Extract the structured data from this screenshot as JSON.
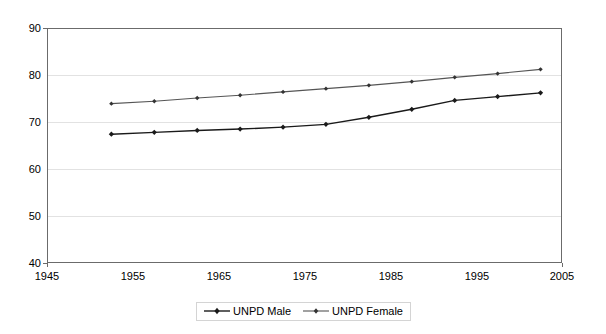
{
  "chart_data": {
    "type": "line",
    "title": "",
    "subtitle": "",
    "xlabel": "",
    "ylabel": "",
    "xlim": [
      1945,
      2005
    ],
    "ylim": [
      40,
      90
    ],
    "x_ticks": [
      1945,
      1955,
      1965,
      1975,
      1985,
      1995,
      2005
    ],
    "y_ticks": [
      40,
      50,
      60,
      70,
      80,
      90
    ],
    "grid": "horizontal",
    "legend_position": "bottom-center",
    "x": [
      1952.5,
      1957.5,
      1962.5,
      1967.5,
      1972.5,
      1977.5,
      1982.5,
      1987.5,
      1992.5,
      1997.5,
      2002.5
    ],
    "series": [
      {
        "name": "UNPD Male",
        "color": "#1a1a1a",
        "marker": "diamond",
        "values": [
          67.4,
          67.8,
          68.2,
          68.5,
          68.9,
          69.5,
          71.0,
          72.7,
          74.6,
          75.4,
          76.2
        ]
      },
      {
        "name": "UNPD Female",
        "color": "#555555",
        "marker": "diamond",
        "values": [
          73.9,
          74.4,
          75.1,
          75.7,
          76.4,
          77.1,
          77.8,
          78.6,
          79.5,
          80.3,
          81.2
        ]
      }
    ]
  },
  "axes": {
    "y_tick_labels": [
      "90",
      "80",
      "70",
      "60",
      "50",
      "40"
    ],
    "x_tick_labels": [
      "1945",
      "1955",
      "1965",
      "1975",
      "1985",
      "1995",
      "2005"
    ]
  },
  "legend": {
    "items": [
      {
        "label": "UNPD Male"
      },
      {
        "label": "UNPD Female"
      }
    ]
  },
  "colors": {
    "male_line": "#1a1a1a",
    "female_line": "#555555",
    "gridline": "#e2e2e2",
    "plot_border": "#6b6b6b",
    "background": "#ffffff"
  }
}
